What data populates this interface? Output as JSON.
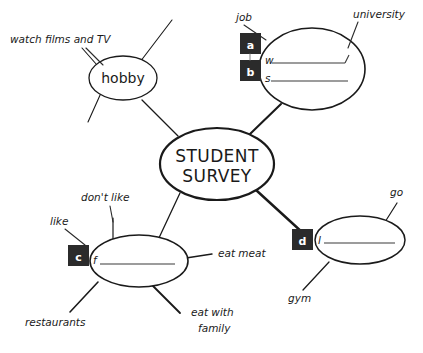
{
  "diagram": {
    "title": "STUDENT SURVEY",
    "type": "mind-map-gap-fill",
    "top_cutoff_text": "",
    "center_node": {
      "line1": "STUDENT",
      "line2": "SURVEY"
    },
    "nodes": [
      {
        "id": "hobby",
        "label": "hobby",
        "gap_letter": "",
        "prompt_stem": ""
      },
      {
        "id": "job-study",
        "label": "",
        "gaps": [
          {
            "letter": "a",
            "stem": "w"
          },
          {
            "letter": "b",
            "stem": "s"
          }
        ]
      },
      {
        "id": "food",
        "label": "",
        "gaps": [
          {
            "letter": "c",
            "stem": "f"
          }
        ]
      },
      {
        "id": "leisure",
        "label": "",
        "gaps": [
          {
            "letter": "d",
            "stem": "l"
          }
        ]
      }
    ],
    "branch_labels": [
      {
        "id": "watch-films-and-tv",
        "text": "watch films and TV"
      },
      {
        "id": "job",
        "text": "job"
      },
      {
        "id": "university",
        "text": "university"
      },
      {
        "id": "dont-like",
        "text": "don't like"
      },
      {
        "id": "like",
        "text": "like"
      },
      {
        "id": "eat-meat",
        "text": "eat meat"
      },
      {
        "id": "restaurants",
        "text": "restaurants"
      },
      {
        "id": "eat-with-family-l1",
        "text": "eat with"
      },
      {
        "id": "eat-with-family-l2",
        "text": "family"
      },
      {
        "id": "go",
        "text": "go"
      },
      {
        "id": "gym",
        "text": "gym"
      }
    ],
    "colors": {
      "ink": "#1a1a1a",
      "gap_box": "#2b2b2b",
      "gap_letter": "#ffffff",
      "paper": "#ffffff"
    }
  }
}
